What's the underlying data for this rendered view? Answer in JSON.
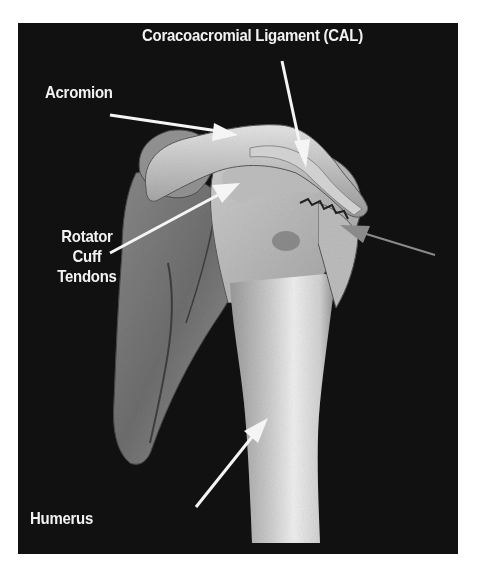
{
  "figure": {
    "background_color": "#111111",
    "page_color": "#ffffff",
    "labels": {
      "cal": "Coracoacromial Ligament (CAL)",
      "acromion": "Acromion",
      "rotator_cuff_line1": "Rotator",
      "rotator_cuff_line2": "Cuff",
      "rotator_cuff_line3": "Tendons",
      "humerus": "Humerus"
    },
    "colors": {
      "label_text": "#f2f2f2",
      "arrow_white": "#f5f5f5",
      "arrow_gray": "#8a8a8a",
      "bone_light": "#d9d9d9",
      "bone_mid": "#a8a8a8",
      "bone_dark": "#6a6a6a"
    }
  }
}
